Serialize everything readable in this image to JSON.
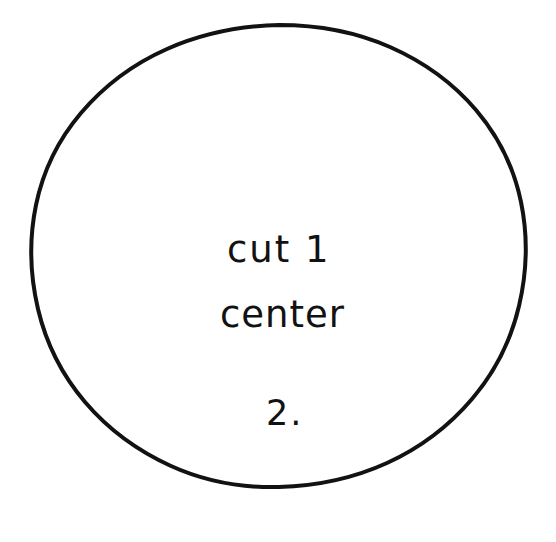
{
  "image": {
    "subject": "hand-drawn circular sewing pattern piece",
    "background_color": "#ffffff",
    "ink_color": "#121212",
    "width": 556,
    "height": 542
  },
  "shape": {
    "name": "circle-outline",
    "style": "hand-drawn",
    "stroke_color": "#121212",
    "stroke_width": 4,
    "center_x": 278,
    "center_y": 268,
    "radius": 244
  },
  "annotations": {
    "cut_instruction": "cut 1",
    "placement_note": "center",
    "piece_number": "2."
  }
}
